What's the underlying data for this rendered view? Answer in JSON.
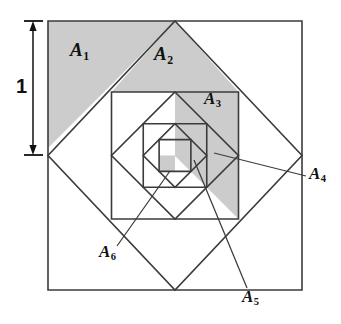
{
  "figure": {
    "type": "geometric-diagram",
    "canvas": {
      "width": 341,
      "height": 324
    },
    "center": {
      "x": 175,
      "y": 155.5
    },
    "dimension": {
      "label": "1",
      "orientation": "vertical",
      "x": 33,
      "y_top": 21,
      "y_bottom": 155,
      "label_x": 20,
      "label_y": 79,
      "meaning": "half the side of the outer square"
    },
    "colors": {
      "stroke": "#3b3b3b",
      "shade": "#cccccc",
      "shade_stroke": "#8a8a8a",
      "text": "#111111",
      "background": "#ffffff",
      "leader": "#3b3b3b"
    },
    "squares": [
      {
        "name": "square-1-outer",
        "orientation": "axis-aligned",
        "points": "48,21 302,21 302,290 48,290"
      },
      {
        "name": "square-2-diamond",
        "orientation": "rotated-45",
        "points": "175,21 302,155.5 175,290 48,155.5"
      },
      {
        "name": "square-3",
        "orientation": "axis-aligned",
        "points": "111.5,92 238.5,92 238.5,219 111.5,219"
      },
      {
        "name": "square-4-diamond",
        "orientation": "rotated-45",
        "points": "175,92 238.5,155.5 175,219 111.5,155.5"
      },
      {
        "name": "square-5",
        "orientation": "axis-aligned",
        "points": "143.25,123.75 206.75,123.75 206.75,187.25 143.25,187.25"
      },
      {
        "name": "square-6-diamond",
        "orientation": "rotated-45",
        "points": "175,123.75 206.75,155.5 175,187.25 143.25,155.5"
      },
      {
        "name": "square-7",
        "orientation": "axis-aligned",
        "points": "159.12,139.62 190.88,139.62 190.88,171.38 159.12,171.38"
      }
    ],
    "shaded_regions": [
      {
        "name": "region-a1",
        "label": "A",
        "sub": "1",
        "points": "48,21 175,21 48,148",
        "label_x": 74,
        "label_y": 48
      },
      {
        "name": "region-a2",
        "label": "A",
        "sub": "2",
        "points": "111.5,92 175,21 238.5,92",
        "label_x": 158,
        "label_y": 52
      },
      {
        "name": "region-a3",
        "label": "A",
        "sub": "3",
        "points": "238.5,92 238.5,219 175,155.5 175,92",
        "label_x": 208,
        "label_y": 98
      },
      {
        "name": "region-a4",
        "label": "A",
        "sub": "4",
        "points": "206.75,123.75 206.75,187.25 175,155.5 175,123.75",
        "label_x": 313,
        "label_y": 182
      },
      {
        "name": "region-a5",
        "label": "A",
        "sub": "5",
        "points": "190.88,139.62 190.88,171.38 175,155.5 175,139.62",
        "label_x": 246,
        "label_y": 296
      },
      {
        "name": "region-a6",
        "label": "A",
        "sub": "6",
        "points": "159.12,155.5 175,155.5 175,171.38 159.12,171.38",
        "label_x": 103,
        "label_y": 252
      }
    ],
    "leaders": [
      {
        "name": "leader-a4",
        "x1": 306,
        "y1": 176,
        "x2": 214,
        "y2": 153
      },
      {
        "name": "leader-a5",
        "x1": 247,
        "y1": 288,
        "x2": 194,
        "y2": 160
      },
      {
        "name": "leader-a6",
        "x1": 117,
        "y1": 246,
        "x2": 170,
        "y2": 171
      }
    ],
    "labels": [
      {
        "name": "label-a1",
        "text": "A",
        "sub": "1",
        "x": 74,
        "y": 48,
        "size": 19
      },
      {
        "name": "label-a2",
        "text": "A",
        "sub": "2",
        "x": 158,
        "y": 52,
        "size": 19
      },
      {
        "name": "label-a3",
        "text": "A",
        "sub": "3",
        "x": 208,
        "y": 98,
        "size": 17
      },
      {
        "name": "label-a4",
        "text": "A",
        "sub": "4",
        "x": 310,
        "y": 173,
        "size": 17
      },
      {
        "name": "label-a5",
        "text": "A",
        "sub": "5",
        "x": 243,
        "y": 288,
        "size": 17
      },
      {
        "name": "label-a6",
        "text": "A",
        "sub": "6",
        "x": 100,
        "y": 243,
        "size": 17
      }
    ]
  }
}
